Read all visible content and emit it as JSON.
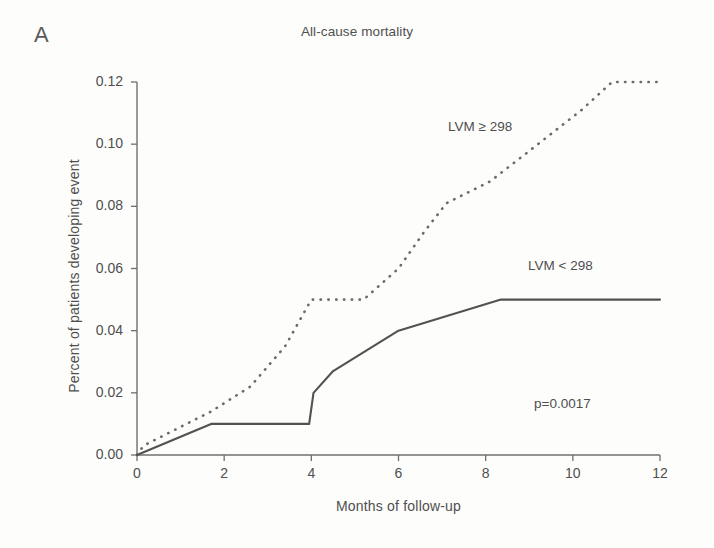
{
  "figure": {
    "panel_label": "A",
    "title": "All-cause mortality"
  },
  "annotations": {
    "high_group": "LVM ≥ 298",
    "low_group": "LVM < 298",
    "pvalue": "p=0.0017"
  },
  "axes": {
    "x_title": "Months of follow-up",
    "y_title": "Percent of patients developing event",
    "x_ticks": [
      "0",
      "2",
      "4",
      "6",
      "8",
      "10",
      "12"
    ],
    "y_ticks": [
      "0.00",
      "0.02",
      "0.04",
      "0.06",
      "0.08",
      "0.10",
      "0.12"
    ]
  },
  "colors": {
    "ink": "#4f4f4f",
    "axis": "#6f6f6f",
    "solid_curve": "#525252",
    "dashed_curve": "#6a6a6a",
    "background": "#fdfdfc"
  },
  "chart_data": {
    "type": "line",
    "title": "All-cause mortality",
    "subtitle": "A",
    "xlabel": "Months of follow-up",
    "ylabel": "Percent of patients developing event",
    "xlim": [
      0,
      12
    ],
    "ylim": [
      0.0,
      0.12
    ],
    "xticks": [
      0,
      2,
      4,
      6,
      8,
      10,
      12
    ],
    "yticks": [
      0.0,
      0.02,
      0.04,
      0.06,
      0.08,
      0.1,
      0.12
    ],
    "grid": false,
    "legend": "inline-annotations",
    "annotations": [
      {
        "text": "LVM ≥ 298",
        "x": 7.2,
        "y": 0.103
      },
      {
        "text": "LVM < 298",
        "x": 9.3,
        "y": 0.0625
      },
      {
        "text": "p=0.0017",
        "x": 9.6,
        "y": 0.0135
      }
    ],
    "series": [
      {
        "name": "LVM ≥ 298",
        "style": "dashed",
        "points": [
          {
            "x": 0.0,
            "y": 0.0
          },
          {
            "x": 0.15,
            "y": 0.003
          },
          {
            "x": 1.7,
            "y": 0.014
          },
          {
            "x": 2.6,
            "y": 0.022
          },
          {
            "x": 3.4,
            "y": 0.035
          },
          {
            "x": 4.0,
            "y": 0.05
          },
          {
            "x": 5.2,
            "y": 0.05
          },
          {
            "x": 6.0,
            "y": 0.06
          },
          {
            "x": 6.6,
            "y": 0.072
          },
          {
            "x": 7.1,
            "y": 0.081
          },
          {
            "x": 8.1,
            "y": 0.088
          },
          {
            "x": 9.2,
            "y": 0.1
          },
          {
            "x": 10.2,
            "y": 0.111
          },
          {
            "x": 10.9,
            "y": 0.12
          },
          {
            "x": 12.0,
            "y": 0.12
          }
        ]
      },
      {
        "name": "LVM < 298",
        "style": "solid",
        "points": [
          {
            "x": 0.0,
            "y": 0.0
          },
          {
            "x": 1.7,
            "y": 0.01
          },
          {
            "x": 3.95,
            "y": 0.01
          },
          {
            "x": 4.05,
            "y": 0.02
          },
          {
            "x": 4.5,
            "y": 0.027
          },
          {
            "x": 6.0,
            "y": 0.04
          },
          {
            "x": 8.35,
            "y": 0.05
          },
          {
            "x": 12.0,
            "y": 0.05
          }
        ]
      }
    ]
  },
  "geometry": {
    "plot_left": 137,
    "plot_right": 660,
    "plot_bottom": 455,
    "plot_top": 82
  }
}
